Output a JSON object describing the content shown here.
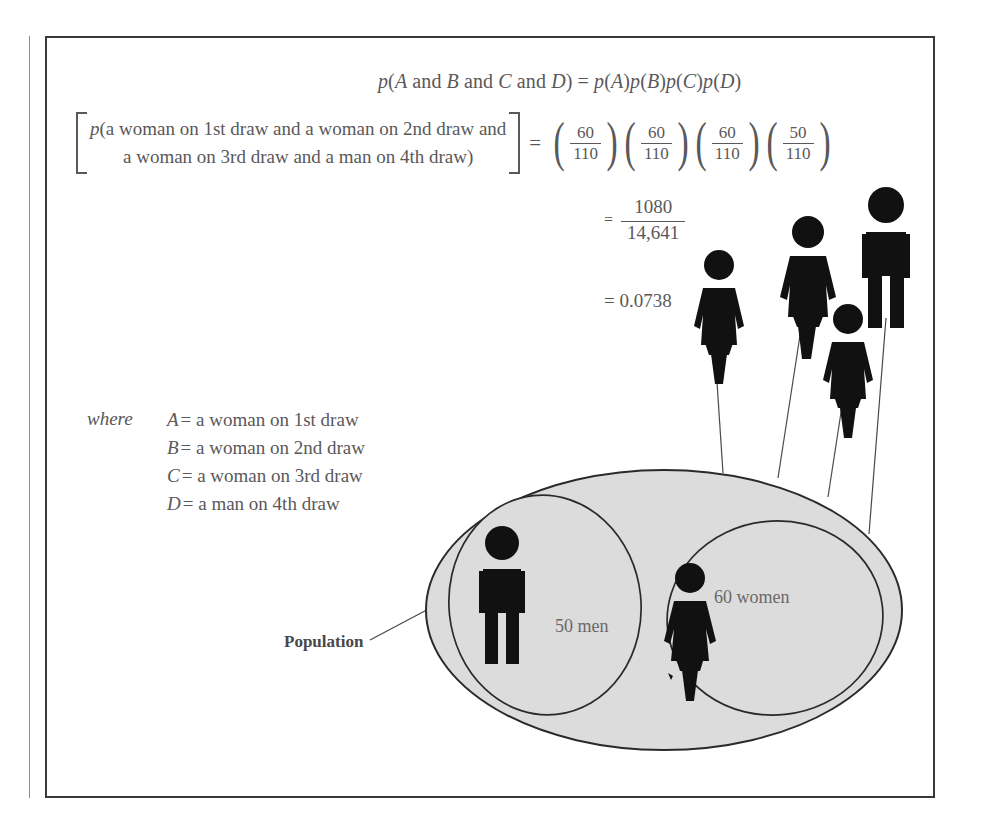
{
  "figure": {
    "equation_main": "p(A and B and C and D) = p(A)p(B)p(C)p(D)",
    "bracket": {
      "line1": "p(a woman on 1st draw and a woman on 2nd draw and",
      "line2": "a woman on 3rd draw and a man on 4th draw)"
    },
    "equals": "=",
    "fractions": [
      {
        "num": "60",
        "den": "110"
      },
      {
        "num": "60",
        "den": "110"
      },
      {
        "num": "60",
        "den": "110"
      },
      {
        "num": "50",
        "den": "110"
      }
    ],
    "result_fraction": {
      "num": "1080",
      "den": "14,641"
    },
    "result_decimal": "= 0.0738",
    "where_label": "where",
    "where_items": [
      {
        "var": "A",
        "eq": "=",
        "text": "a woman on 1st draw"
      },
      {
        "var": "B",
        "eq": "=",
        "text": "a woman on 2nd draw"
      },
      {
        "var": "C",
        "eq": "=",
        "text": "a woman on 3rd draw"
      },
      {
        "var": "D",
        "eq": "=",
        "text": "a man on 4th draw"
      }
    ],
    "population_label": "Population",
    "men_label": "50 men",
    "women_label": "60 women",
    "paren_open": "(",
    "paren_close": ")"
  },
  "colors": {
    "ellipse_fill": "#dcdcdc",
    "ellipse_stroke": "#2b292b",
    "figure_black": "#111111",
    "text": "#5a585a",
    "border": "#3a383a"
  }
}
